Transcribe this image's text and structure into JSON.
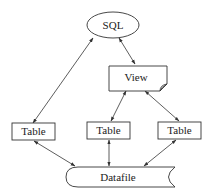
{
  "diagram": {
    "nodes": {
      "sql": {
        "label": "SQL",
        "shape": "ellipse"
      },
      "view": {
        "label": "View",
        "shape": "document"
      },
      "table_left": {
        "label": "Table",
        "shape": "rectangle"
      },
      "table_mid": {
        "label": "Table",
        "shape": "rectangle"
      },
      "table_right": {
        "label": "Table",
        "shape": "rectangle"
      },
      "datafile": {
        "label": "Datafile",
        "shape": "stored-data"
      }
    },
    "edges": [
      {
        "from": "sql",
        "to": "table_left",
        "arrows": "both"
      },
      {
        "from": "sql",
        "to": "view",
        "arrows": "both"
      },
      {
        "from": "view",
        "to": "table_mid",
        "arrows": "both"
      },
      {
        "from": "view",
        "to": "table_right",
        "arrows": "both"
      },
      {
        "from": "table_left",
        "to": "datafile",
        "arrows": "both"
      },
      {
        "from": "table_mid",
        "to": "datafile",
        "arrows": "both"
      },
      {
        "from": "table_right",
        "to": "datafile",
        "arrows": "both"
      }
    ],
    "colors": {
      "stroke": "#333333",
      "fill": "#ffffff",
      "text": "#222222"
    }
  }
}
